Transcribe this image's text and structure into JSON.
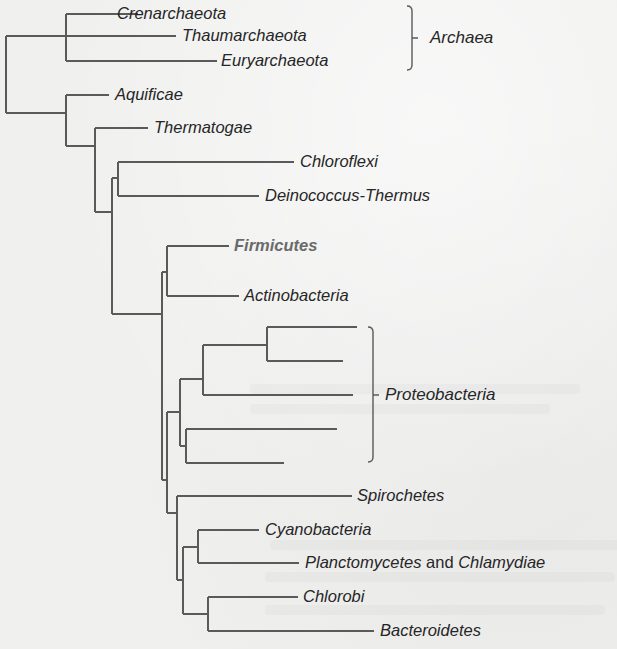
{
  "diagram": {
    "type": "phylogenetic-tree",
    "colors": {
      "background": "#f0f0ef",
      "branch": "#5a5a5a",
      "label": "#262626",
      "highlight_label": "#6a6a6a"
    },
    "leaves": [
      {
        "id": "crenarchaeota",
        "label": "Crenarchaeota",
        "x": 115,
        "y": 14
      },
      {
        "id": "thaumarchaeota",
        "label": "Thaumarchaeota",
        "x": 180,
        "y": 36
      },
      {
        "id": "euryarchaeota",
        "label": "Euryarchaeota",
        "x": 219,
        "y": 61
      },
      {
        "id": "aquificae",
        "label": "Aquificae",
        "x": 113,
        "y": 95
      },
      {
        "id": "thermatogae",
        "label": "Thermatogae",
        "x": 152,
        "y": 128
      },
      {
        "id": "chloroflexi",
        "label": "Chloroflexi",
        "x": 298,
        "y": 162
      },
      {
        "id": "deinococcus-thermus",
        "label": "Deinococcus-Thermus",
        "x": 263,
        "y": 196
      },
      {
        "id": "firmicutes",
        "label": "Firmicutes",
        "x": 232,
        "y": 246,
        "highlight": true
      },
      {
        "id": "actinobacteria",
        "label": "Actinobacteria",
        "x": 242,
        "y": 296
      },
      {
        "id": "spirochetes",
        "label": "Spirochetes",
        "x": 355,
        "y": 496
      },
      {
        "id": "cyanobacteria",
        "label": "Cyanobacteria",
        "x": 263,
        "y": 530
      },
      {
        "id": "planctomycetes-chlamydiae",
        "label_parts": [
          {
            "text": "Planctomycetes",
            "italic": true
          },
          {
            "text": " and ",
            "italic": false
          },
          {
            "text": "Chlamydiae",
            "italic": true
          }
        ],
        "x": 303,
        "y": 563
      },
      {
        "id": "chlorobi",
        "label": "Chlorobi",
        "x": 301,
        "y": 597
      },
      {
        "id": "bacteroidetes",
        "label": "Bacteroidetes",
        "x": 378,
        "y": 631
      }
    ],
    "groups": [
      {
        "id": "archaea",
        "label": "Archaea",
        "bracket_x": 412,
        "y_top": 6,
        "y_bottom": 70,
        "label_x": 430,
        "label_y": 38
      },
      {
        "id": "proteobacteria",
        "label": "Proteobacteria",
        "bracket_x": 373,
        "y_top": 327,
        "y_bottom": 462,
        "label_x": 385,
        "label_y": 395
      }
    ],
    "branches": [
      [
        6,
        36,
        6,
        113
      ],
      [
        6,
        36,
        176,
        36
      ],
      [
        6,
        113,
        66,
        113
      ],
      [
        66,
        14,
        66,
        61
      ],
      [
        66,
        14,
        138,
        14
      ],
      [
        66,
        61,
        217,
        61
      ],
      [
        66,
        95,
        66,
        146
      ],
      [
        66,
        95,
        109,
        95
      ],
      [
        66,
        146,
        95,
        146
      ],
      [
        95,
        128,
        95,
        212
      ],
      [
        95,
        128,
        148,
        128
      ],
      [
        95,
        212,
        112,
        212
      ],
      [
        112,
        178,
        112,
        314
      ],
      [
        112,
        178,
        118,
        178
      ],
      [
        118,
        162,
        118,
        196
      ],
      [
        118,
        162,
        294,
        162
      ],
      [
        118,
        196,
        259,
        196
      ],
      [
        112,
        314,
        162,
        314
      ],
      [
        162,
        272,
        162,
        480
      ],
      [
        162,
        272,
        167,
        272
      ],
      [
        167,
        246,
        167,
        296
      ],
      [
        167,
        246,
        229,
        246
      ],
      [
        167,
        296,
        239,
        296
      ],
      [
        162,
        480,
        167,
        480
      ],
      [
        167,
        412,
        167,
        513
      ],
      [
        167,
        412,
        180,
        412
      ],
      [
        180,
        379,
        180,
        446
      ],
      [
        180,
        379,
        203,
        379
      ],
      [
        203,
        345,
        203,
        395
      ],
      [
        203,
        345,
        267,
        345
      ],
      [
        267,
        327,
        267,
        361
      ],
      [
        267,
        327,
        357,
        327
      ],
      [
        267,
        361,
        343,
        361
      ],
      [
        203,
        395,
        353,
        395
      ],
      [
        180,
        446,
        186,
        446
      ],
      [
        186,
        429,
        186,
        463
      ],
      [
        186,
        429,
        337,
        429
      ],
      [
        186,
        463,
        284,
        463
      ],
      [
        167,
        513,
        177,
        513
      ],
      [
        177,
        496,
        177,
        580
      ],
      [
        177,
        496,
        352,
        496
      ],
      [
        177,
        580,
        183,
        580
      ],
      [
        183,
        547,
        183,
        614
      ],
      [
        183,
        547,
        198,
        547
      ],
      [
        198,
        530,
        198,
        563
      ],
      [
        198,
        530,
        259,
        530
      ],
      [
        198,
        563,
        299,
        563
      ],
      [
        183,
        614,
        208,
        614
      ],
      [
        208,
        597,
        208,
        631
      ],
      [
        208,
        597,
        298,
        597
      ],
      [
        208,
        631,
        374,
        631
      ]
    ]
  }
}
